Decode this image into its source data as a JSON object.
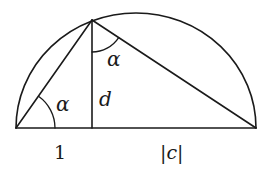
{
  "diagram": {
    "type": "semicircle-geometry",
    "semicircle": {
      "center": [
        136,
        128
      ],
      "radius": 120
    },
    "points": {
      "A": [
        16,
        128
      ],
      "B": [
        256,
        128
      ],
      "P": [
        92,
        20
      ],
      "F": [
        92,
        128
      ]
    },
    "labels": {
      "alpha_bottom": "α",
      "alpha_top": "α",
      "height": "d",
      "left_segment": "1",
      "right_segment": "|c|"
    },
    "colors": {
      "line": "#1a1a1a",
      "background": "#ffffff"
    }
  }
}
